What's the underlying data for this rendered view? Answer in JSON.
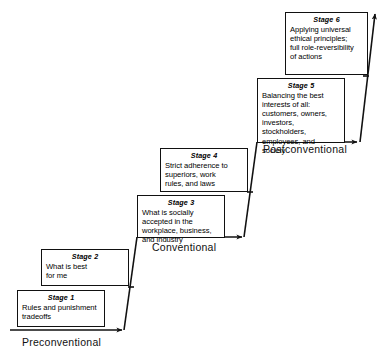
{
  "diagram": {
    "type": "staircase-flow",
    "line_color": "#111111",
    "box_border_color": "#111111",
    "background_color": "#ffffff",
    "stages": [
      {
        "id": "stage-1",
        "title": "Stage 1",
        "body": "Rules and punishment\ntradeoffs",
        "level": "Preconventional"
      },
      {
        "id": "stage-2",
        "title": "Stage 2",
        "body": "What is best\nfor me",
        "level": "Preconventional"
      },
      {
        "id": "stage-3",
        "title": "Stage 3",
        "body": "What is socially\naccepted in the\nworkplace, business,\nand industry",
        "level": "Conventional"
      },
      {
        "id": "stage-4",
        "title": "Stage 4",
        "body": "Strict adherence to\nsuperiors, work\nrules, and laws",
        "level": "Conventional"
      },
      {
        "id": "stage-5",
        "title": "Stage 5",
        "body": "Balancing the best\ninterests of all:\ncustomers, owners,\ninvestors, stockholders,\nemployees, and\nsociety",
        "level": "Postconventional"
      },
      {
        "id": "stage-6",
        "title": "Stage 6",
        "body": "Applying universal\nethical principles;\nfull role-reversibility\nof actions",
        "level": "Postconventional"
      }
    ],
    "levels": [
      {
        "id": "level-preconventional",
        "label": "Preconventional"
      },
      {
        "id": "level-conventional",
        "label": "Conventional"
      },
      {
        "id": "level-postconventional",
        "label": "Postconventional"
      }
    ]
  }
}
